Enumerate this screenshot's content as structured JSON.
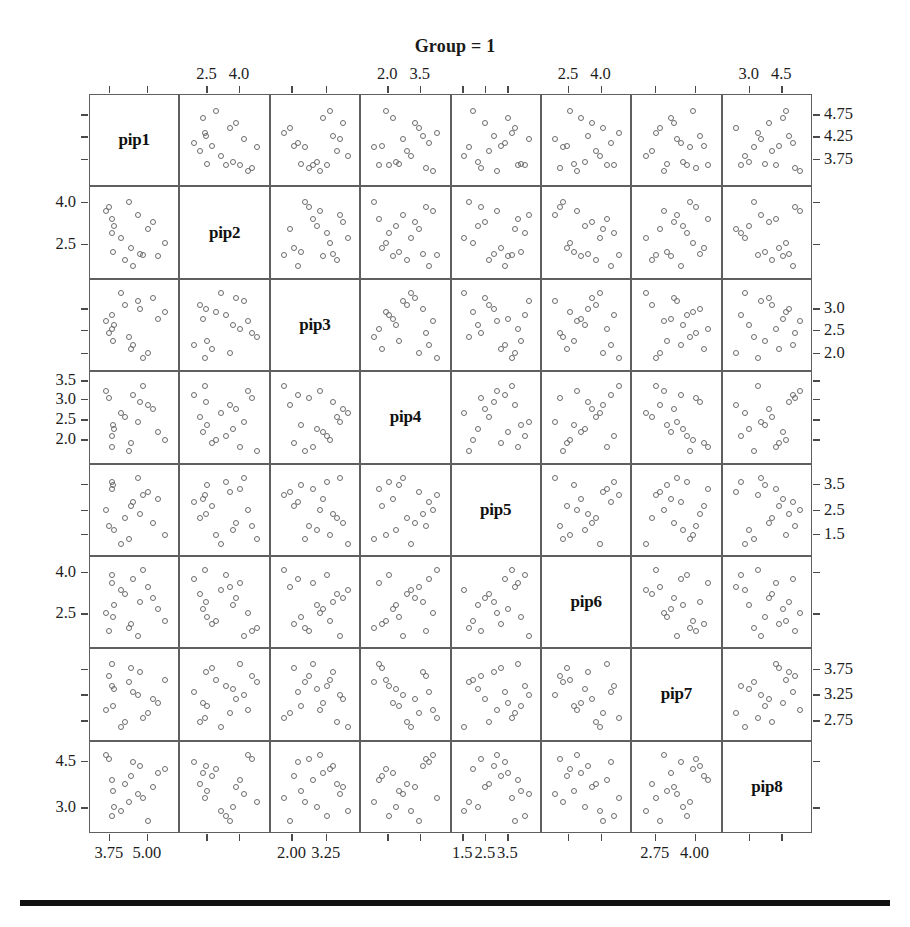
{
  "figure": {
    "title": "Group = 1",
    "type": "scatterplot-matrix",
    "variables": [
      "pip1",
      "pip2",
      "pip3",
      "pip4",
      "pip5",
      "pip6",
      "pip7",
      "pip8"
    ],
    "n_rows": 8,
    "n_cols": 8,
    "point_marker": "open-circle",
    "point_color": "#6b6b6b",
    "panel_border_color": "#5f5f5f",
    "background_color": "#ffffff",
    "rule_color": "#111111"
  },
  "axes": {
    "top": [
      {
        "col": 2,
        "ticks": [
          {
            "label": "2.5",
            "pos": 0.3
          },
          {
            "label": "4.0",
            "pos": 0.66
          }
        ]
      },
      {
        "col": 4,
        "ticks": [
          {
            "label": "2.0",
            "pos": 0.3
          },
          {
            "label": "3.5",
            "pos": 0.66
          }
        ]
      },
      {
        "col": 6,
        "ticks": [
          {
            "label": "2.5",
            "pos": 0.3
          },
          {
            "label": "4.0",
            "pos": 0.66
          }
        ]
      },
      {
        "col": 8,
        "ticks": [
          {
            "label": "3.0",
            "pos": 0.3
          },
          {
            "label": "4.5",
            "pos": 0.66
          }
        ]
      }
    ],
    "bottom": [
      {
        "col": 1,
        "ticks": [
          {
            "label": "3.75",
            "pos": 0.22
          },
          {
            "label": "5.00",
            "pos": 0.64
          }
        ]
      },
      {
        "col": 3,
        "ticks": [
          {
            "label": "2.00",
            "pos": 0.24
          },
          {
            "label": "3.25",
            "pos": 0.62
          }
        ]
      },
      {
        "col": 5,
        "ticks": [
          {
            "label": "1.5",
            "pos": 0.13
          },
          {
            "label": "2.5",
            "pos": 0.38
          },
          {
            "label": "3.5",
            "pos": 0.63
          }
        ]
      },
      {
        "col": 7,
        "ticks": [
          {
            "label": "2.75",
            "pos": 0.26
          },
          {
            "label": "4.00",
            "pos": 0.7
          }
        ]
      }
    ],
    "left": [
      {
        "row": 2,
        "ticks": [
          {
            "label": "4.0",
            "pos": 0.17
          },
          {
            "label": "2.5",
            "pos": 0.62
          }
        ]
      },
      {
        "row": 4,
        "ticks": [
          {
            "label": "3.5",
            "pos": 0.1
          },
          {
            "label": "3.0",
            "pos": 0.3
          },
          {
            "label": "2.5",
            "pos": 0.52
          },
          {
            "label": "2.0",
            "pos": 0.74
          }
        ]
      },
      {
        "row": 6,
        "ticks": [
          {
            "label": "4.0",
            "pos": 0.17
          },
          {
            "label": "2.5",
            "pos": 0.62
          }
        ]
      },
      {
        "row": 8,
        "ticks": [
          {
            "label": "4.5",
            "pos": 0.22
          },
          {
            "label": "3.0",
            "pos": 0.72
          }
        ]
      }
    ],
    "right": [
      {
        "row": 1,
        "ticks": [
          {
            "label": "4.75",
            "pos": 0.22
          },
          {
            "label": "4.25",
            "pos": 0.46
          },
          {
            "label": "3.75",
            "pos": 0.7
          }
        ]
      },
      {
        "row": 3,
        "ticks": [
          {
            "label": "3.0",
            "pos": 0.32
          },
          {
            "label": "2.5",
            "pos": 0.55
          },
          {
            "label": "2.0",
            "pos": 0.8
          }
        ]
      },
      {
        "row": 5,
        "ticks": [
          {
            "label": "3.5",
            "pos": 0.22
          },
          {
            "label": "2.5",
            "pos": 0.5
          },
          {
            "label": "1.5",
            "pos": 0.76
          }
        ]
      },
      {
        "row": 7,
        "ticks": [
          {
            "label": "3.75",
            "pos": 0.22
          },
          {
            "label": "3.25",
            "pos": 0.5
          },
          {
            "label": "2.75",
            "pos": 0.78
          }
        ]
      }
    ],
    "untick_rows": [
      1,
      3,
      5,
      7
    ],
    "untick_cols": [
      2,
      4,
      6,
      8
    ]
  },
  "chart_data": {
    "type": "scatter",
    "title": "Group = 1",
    "xlabel": "",
    "ylabel": "",
    "variables": [
      "pip1",
      "pip2",
      "pip3",
      "pip4",
      "pip5",
      "pip6",
      "pip7",
      "pip8"
    ],
    "n_observations": 18,
    "series": [
      {
        "name": "pip1",
        "values": [
          3.62,
          3.7,
          3.78,
          3.8,
          3.83,
          3.86,
          4.05,
          4.18,
          4.3,
          4.35,
          4.42,
          4.55,
          4.62,
          4.7,
          4.85,
          5.0,
          5.15,
          5.35
        ]
      },
      {
        "name": "pip2",
        "values": [
          2.1,
          2.32,
          2.45,
          2.5,
          2.55,
          2.6,
          2.78,
          2.95,
          3.15,
          3.35,
          3.5,
          3.62,
          3.75,
          3.9,
          4.05,
          4.2,
          4.35,
          4.55
        ]
      },
      {
        "name": "pip3",
        "values": [
          1.75,
          1.92,
          2.05,
          2.18,
          2.3,
          2.42,
          2.55,
          2.68,
          2.8,
          2.92,
          3.0,
          3.12,
          3.22,
          3.32,
          3.45,
          3.55,
          3.65,
          3.8
        ]
      },
      {
        "name": "pip4",
        "values": [
          1.82,
          1.95,
          2.05,
          2.15,
          2.25,
          2.35,
          2.45,
          2.55,
          2.65,
          2.78,
          2.9,
          3.0,
          3.12,
          3.22,
          3.32,
          3.42,
          3.52,
          3.65
        ]
      },
      {
        "name": "pip5",
        "values": [
          1.25,
          1.45,
          1.62,
          1.8,
          1.95,
          2.1,
          2.28,
          2.45,
          2.6,
          2.75,
          2.9,
          3.05,
          3.18,
          3.32,
          3.45,
          3.58,
          3.72,
          3.88
        ]
      },
      {
        "name": "pip6",
        "values": [
          2.3,
          2.45,
          2.55,
          2.68,
          2.8,
          2.92,
          3.05,
          3.18,
          3.3,
          3.42,
          3.55,
          3.68,
          3.8,
          3.92,
          4.05,
          4.18,
          4.3,
          4.45
        ]
      },
      {
        "name": "pip7",
        "values": [
          2.55,
          2.7,
          2.82,
          2.95,
          3.05,
          3.15,
          3.25,
          3.35,
          3.45,
          3.55,
          3.62,
          3.72,
          3.82,
          3.9,
          4.0,
          4.1,
          4.22,
          4.35
        ]
      },
      {
        "name": "pip8",
        "values": [
          2.85,
          3.02,
          3.18,
          3.32,
          3.48,
          3.62,
          3.75,
          3.88,
          4.0,
          4.12,
          4.25,
          4.38,
          4.5,
          4.62,
          4.72,
          4.85,
          4.95,
          5.1
        ]
      }
    ],
    "axis_ranges": {
      "pip1": [
        3.4,
        5.55
      ],
      "pip2": [
        1.9,
        4.75
      ],
      "pip3": [
        1.6,
        3.95
      ],
      "pip4": [
        1.7,
        3.8
      ],
      "pip5": [
        1.1,
        4.05
      ],
      "pip6": [
        2.15,
        4.6
      ],
      "pip7": [
        2.4,
        4.5
      ],
      "pip8": [
        2.7,
        5.25
      ]
    },
    "grid": false,
    "legend": "none"
  }
}
